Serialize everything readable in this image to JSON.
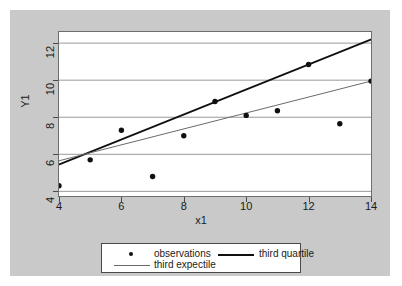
{
  "chart_data": {
    "type": "scatter",
    "title": "",
    "xlabel": "x1",
    "ylabel": "Y1",
    "xlim": [
      4,
      14
    ],
    "ylim": [
      3.75,
      12.6
    ],
    "xticks": [
      4,
      6,
      8,
      10,
      12,
      14
    ],
    "yticks": [
      4,
      6,
      8,
      10,
      12
    ],
    "grid": true,
    "legend_position": "bottom",
    "series": [
      {
        "name": "observations",
        "type": "scatter",
        "marker": "circle",
        "color": "#101010",
        "x": [
          4,
          5,
          6,
          7,
          8,
          9,
          10,
          11,
          12,
          13,
          14
        ],
        "values": [
          4.3,
          5.7,
          7.3,
          4.8,
          7.0,
          8.85,
          8.1,
          8.35,
          10.85,
          7.65,
          9.95
        ]
      },
      {
        "name": "third quartile",
        "type": "line",
        "color": "#101010",
        "width": 1.8,
        "x": [
          4,
          14
        ],
        "values": [
          5.45,
          12.2
        ]
      },
      {
        "name": "third expectile",
        "type": "line",
        "color": "#6a6a6a",
        "width": 1.0,
        "x": [
          4,
          14
        ],
        "values": [
          5.65,
          9.95
        ]
      }
    ]
  },
  "axes": {
    "y_label": "Y1",
    "x_label": "x1",
    "y_tick_labels": [
      "4",
      "6",
      "8",
      "10",
      "12"
    ],
    "x_tick_labels": [
      "4",
      "6",
      "8",
      "10",
      "12",
      "14"
    ]
  },
  "legend": {
    "entries": [
      {
        "label": "observations",
        "glyph": "dot"
      },
      {
        "label": "third quartile",
        "glyph": "dark-line"
      },
      {
        "label": "third expectile",
        "glyph": "gray-line"
      }
    ]
  },
  "colors": {
    "panel_background": "#c9c9c9",
    "plot_background": "#ffffff",
    "grid": "#9a9a9a",
    "frame": "#6e6e6e",
    "quartile_line": "#101010",
    "expectile_line": "#6a6a6a",
    "marker": "#101010"
  }
}
